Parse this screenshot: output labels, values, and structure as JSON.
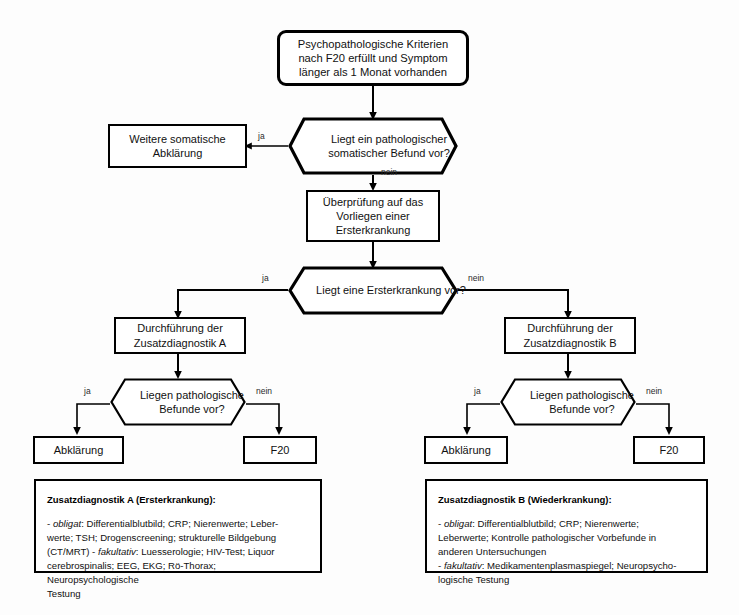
{
  "diagram": {
    "nodes": {
      "start": {
        "shape": "rounded-rect",
        "text": "Psychopathologische Kriterien nach F20 erfüllt und Symptom länger als 1 Monat vorhanden"
      },
      "decision_somatic": {
        "shape": "hexagon",
        "text": "Liegt ein pathologischer somatischer Befund vor?"
      },
      "somatic_clarify": {
        "shape": "rect",
        "text": "Weitere somatische Abklärung"
      },
      "check_first_illness": {
        "shape": "rect",
        "text": "Überprüfung auf das Vorliegen einer Ersterkrankung"
      },
      "decision_first_illness": {
        "shape": "hexagon",
        "text": "Liegt eine Ersterkrankung vor?"
      },
      "perform_a": {
        "shape": "rect",
        "text": "Durchführung der Zusatzdiagnostik A"
      },
      "perform_b": {
        "shape": "rect",
        "text": "Durchführung der Zusatzdiagnostik B"
      },
      "decision_findings_a": {
        "shape": "hexagon",
        "text": "Liegen pathologische Befunde vor?"
      },
      "decision_findings_b": {
        "shape": "hexagon",
        "text": "Liegen pathologische Befunde vor?"
      },
      "clarify_a": {
        "shape": "rect",
        "text": "Abklärung"
      },
      "f20_a": {
        "shape": "rect",
        "text": "F20"
      },
      "clarify_b": {
        "shape": "rect",
        "text": "Abklärung"
      },
      "f20_b": {
        "shape": "rect",
        "text": "F20"
      }
    },
    "edge_labels": {
      "somatic_yes": "ja",
      "somatic_no": "nein",
      "first_illness_yes": "ja",
      "first_illness_no": "nein",
      "findings_a_yes": "ja",
      "findings_a_no": "nein",
      "findings_b_yes": "ja",
      "findings_b_no": "nein"
    },
    "legends": {
      "a": {
        "title": "Zusatzdiagnostik A (Ersterkrankung):",
        "body": "- obligat: Differentialblutbild; CRP; Nierenwerte; Leber-\nwerte; TSH; Drogenscreening; strukturelle Bildgebung\n(CT/MRT) - fakultativ: Luesserologie; HIV-Test; Liquor\ncerebrospinalis; EEG, EKG; Rö-Thorax; Neuropsychologische\nTestung",
        "italics": [
          "obligat",
          "fakultativ"
        ]
      },
      "b": {
        "title": "Zusatzdiagnostik B (Wiederkrankung):",
        "body": "- obligat: Differentialblutbild; CRP; Nierenwerte;\nLeberwerte; Kontrolle pathologischer Vorbefunde in\nanderen Untersuchungen\n- fakultativ: Medikamentenplasmaspiegel; Neuropsycho-\nlogische Testung",
        "italics": [
          "obligat",
          "fakultativ"
        ]
      }
    },
    "colors": {
      "stroke": "#000000",
      "background": "#fdfdfd",
      "text": "#111111"
    }
  }
}
